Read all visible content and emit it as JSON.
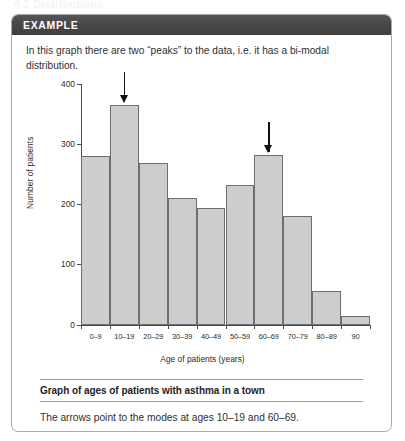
{
  "page": {
    "running_head": "4.2  Distributions"
  },
  "card": {
    "header_label": "EXAMPLE",
    "intro": "In this graph there are two “peaks” to the data, i.e. it has a bi-modal distribution.",
    "caption": "Graph of ages of patients with asthma in a town",
    "footnote": "The arrows point to the modes at ages 10–19 and 60–69."
  },
  "chart_data": {
    "type": "bar",
    "title": "",
    "xlabel": "Age of patients (years)",
    "ylabel": "Number of patients",
    "categories": [
      "0–9",
      "10–19",
      "20–29",
      "30–39",
      "40–49",
      "50–59",
      "60–69",
      "70–79",
      "80–89",
      "90"
    ],
    "values": [
      280,
      365,
      268,
      210,
      193,
      232,
      282,
      180,
      55,
      15
    ],
    "ylim": [
      0,
      400
    ],
    "yticks": [
      0,
      100,
      200,
      300,
      400
    ],
    "ytick_labels": [
      "0",
      "100",
      "200",
      "300",
      "400"
    ],
    "grid": false,
    "legend": false,
    "bar_fill": "#cdcdcd",
    "bar_stroke": "#6e6e6e",
    "annotations": [
      {
        "label": "mode-arrow-10-19",
        "category": "10–19",
        "value": 365
      },
      {
        "label": "mode-arrow-60-69",
        "category": "60–69",
        "value": 282
      }
    ]
  }
}
